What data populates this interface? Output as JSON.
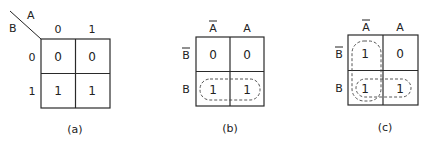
{
  "maps": [
    {
      "id": "a",
      "caption": "(a)",
      "corner": {
        "col_var": "A",
        "row_var": "B"
      },
      "col_headers": [
        "0",
        "1"
      ],
      "row_headers": [
        "0",
        "1"
      ],
      "cells": [
        [
          "0",
          "0"
        ],
        [
          "1",
          "1"
        ]
      ],
      "loops": []
    },
    {
      "id": "b",
      "caption": "(b)",
      "col_headers": [
        "A",
        "A"
      ],
      "col_header_overbar": [
        true,
        false
      ],
      "row_headers": [
        "B",
        "B"
      ],
      "row_header_overbar": [
        true,
        false
      ],
      "cells": [
        [
          "0",
          "0"
        ],
        [
          "1",
          "1"
        ]
      ],
      "loops": [
        {
          "cells": [
            "B,A-bar",
            "B,A"
          ],
          "orientation": "horizontal"
        }
      ]
    },
    {
      "id": "c",
      "caption": "(c)",
      "col_headers": [
        "A",
        "A"
      ],
      "col_header_overbar": [
        true,
        false
      ],
      "row_headers": [
        "B",
        "B"
      ],
      "row_header_overbar": [
        true,
        false
      ],
      "cells": [
        [
          "1",
          "0"
        ],
        [
          "1",
          "1"
        ]
      ],
      "loops": [
        {
          "cells": [
            "B-bar,A-bar",
            "B,A-bar"
          ],
          "orientation": "vertical"
        },
        {
          "cells": [
            "B,A-bar",
            "B,A"
          ],
          "orientation": "horizontal"
        }
      ]
    }
  ],
  "colors": {
    "ink": "#222222",
    "background": "#ffffff"
  }
}
